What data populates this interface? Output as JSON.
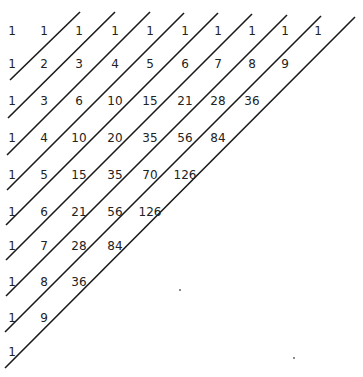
{
  "grid": [
    [
      1,
      1,
      1,
      1,
      1,
      1,
      1,
      1,
      1,
      1
    ],
    [
      1,
      2,
      3,
      4,
      5,
      6,
      7,
      8,
      9
    ],
    [
      1,
      3,
      6,
      10,
      15,
      21,
      28,
      36
    ],
    [
      1,
      4,
      10,
      20,
      35,
      56,
      84
    ],
    [
      1,
      5,
      15,
      35,
      70,
      126
    ],
    [
      1,
      6,
      21,
      56,
      126
    ],
    [
      1,
      7,
      28,
      84
    ],
    [
      1,
      8,
      36
    ],
    [
      1,
      9
    ],
    [
      1
    ]
  ],
  "layout": {
    "col_x": [
      12,
      44,
      79,
      115,
      150,
      185,
      218,
      252,
      285,
      318
    ],
    "row_y": [
      31,
      64,
      101,
      138,
      175,
      212,
      246,
      282,
      318,
      352
    ]
  },
  "lines": [
    {
      "x1": 80,
      "y1": 12,
      "x2": 10,
      "y2": 80
    },
    {
      "x1": 115,
      "y1": 12,
      "x2": 8,
      "y2": 118
    },
    {
      "x1": 150,
      "y1": 12,
      "x2": 7,
      "y2": 155
    },
    {
      "x1": 184,
      "y1": 13,
      "x2": 7,
      "y2": 190
    },
    {
      "x1": 218,
      "y1": 13,
      "x2": 6,
      "y2": 225
    },
    {
      "x1": 252,
      "y1": 14,
      "x2": 6,
      "y2": 260
    },
    {
      "x1": 287,
      "y1": 15,
      "x2": 6,
      "y2": 296
    },
    {
      "x1": 321,
      "y1": 16,
      "x2": 5,
      "y2": 332
    },
    {
      "x1": 355,
      "y1": 17,
      "x2": 5,
      "y2": 368
    }
  ],
  "specks": [
    {
      "x": 180,
      "y": 290
    },
    {
      "x": 294,
      "y": 358
    }
  ],
  "colors": {
    "line": "#1a1a1a",
    "text": "#222222"
  }
}
